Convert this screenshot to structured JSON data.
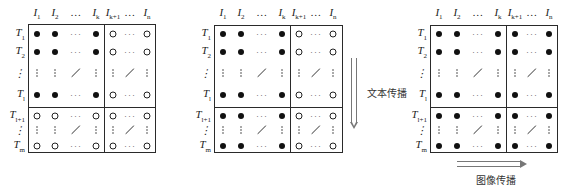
{
  "figure": {
    "columns": [
      {
        "base": "I",
        "sub": "1"
      },
      {
        "base": "I",
        "sub": "2"
      },
      {
        "base": "…",
        "sub": ""
      },
      {
        "base": "I",
        "sub": "k"
      },
      {
        "base": "I",
        "sub": "k+1"
      },
      {
        "base": "…",
        "sub": ""
      },
      {
        "base": "I",
        "sub": "n"
      }
    ],
    "rows": [
      {
        "base": "T",
        "sub": "1"
      },
      {
        "base": "T",
        "sub": "2"
      },
      {
        "base": "⋮",
        "sub": ""
      },
      {
        "base": "T",
        "sub": "l"
      },
      {
        "base": "T",
        "sub": "l+1"
      },
      {
        "base": "⋮",
        "sub": ""
      },
      {
        "base": "T",
        "sub": "m"
      }
    ],
    "legend": {
      "filled": "filled-dot",
      "empty": "empty-dot"
    },
    "panels": [
      {
        "id": "panel-initial",
        "cells": [
          [
            "F",
            "F",
            "h",
            "F",
            "E",
            "h",
            "E"
          ],
          [
            "F",
            "F",
            "h",
            "F",
            "E",
            "h",
            "E"
          ],
          [
            "v",
            "v",
            "d",
            "v",
            "v",
            "d",
            "v"
          ],
          [
            "F",
            "F",
            "h",
            "F",
            "E",
            "h",
            "E"
          ],
          [
            "E",
            "E",
            "h",
            "E",
            "E",
            "h",
            "E"
          ],
          [
            "v",
            "v",
            "d",
            "v",
            "v",
            "d",
            "v"
          ],
          [
            "E",
            "E",
            "h",
            "E",
            "E",
            "h",
            "E"
          ]
        ]
      },
      {
        "id": "panel-text-propagated",
        "cells": [
          [
            "F",
            "F",
            "h",
            "F",
            "E",
            "h",
            "E"
          ],
          [
            "F",
            "F",
            "h",
            "F",
            "E",
            "h",
            "E"
          ],
          [
            "v",
            "v",
            "d",
            "v",
            "v",
            "d",
            "v"
          ],
          [
            "F",
            "F",
            "h",
            "F",
            "E",
            "h",
            "E"
          ],
          [
            "F",
            "F",
            "h",
            "F",
            "E",
            "h",
            "E"
          ],
          [
            "v",
            "v",
            "d",
            "v",
            "v",
            "d",
            "v"
          ],
          [
            "F",
            "F",
            "h",
            "F",
            "E",
            "h",
            "E"
          ]
        ]
      },
      {
        "id": "panel-image-propagated",
        "cells": [
          [
            "F",
            "F",
            "h",
            "F",
            "F",
            "h",
            "F"
          ],
          [
            "F",
            "F",
            "h",
            "F",
            "F",
            "h",
            "F"
          ],
          [
            "v",
            "v",
            "d",
            "v",
            "v",
            "d",
            "v"
          ],
          [
            "F",
            "F",
            "h",
            "F",
            "F",
            "h",
            "F"
          ],
          [
            "F",
            "F",
            "h",
            "F",
            "F",
            "h",
            "F"
          ],
          [
            "v",
            "v",
            "d",
            "v",
            "v",
            "d",
            "v"
          ],
          [
            "F",
            "F",
            "h",
            "F",
            "F",
            "h",
            "F"
          ]
        ]
      }
    ],
    "arrows": {
      "text_propagation": {
        "label": "文本传播",
        "direction": "down"
      },
      "image_propagation": {
        "label": "图像传播",
        "direction": "right"
      }
    }
  }
}
